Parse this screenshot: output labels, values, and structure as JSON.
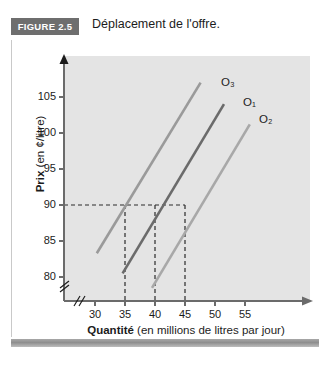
{
  "figure": {
    "badge": "FIGURE 2.5",
    "caption": "Déplacement de l'offre."
  },
  "colors": {
    "badge_bg": "#6e6e6e",
    "plot_bg": "#e4e4e4",
    "axis": "#6b6b6b",
    "curve_o1": "#6b6b6b",
    "curve_o2": "#a8a8a8",
    "curve_o3": "#9a9a9a",
    "dashed": "#2b2b2b",
    "text": "#1c1c1c"
  },
  "chart_data": {
    "type": "line",
    "title": "Déplacement de l'offre.",
    "xlabel_bold": "Quantité",
    "xlabel_rest": " (en millions de litres par jour)",
    "ylabel_bold": "Prix",
    "ylabel_rest": " (en ¢/litre)",
    "xlim": [
      27.5,
      57.5
    ],
    "ylim": [
      77.5,
      108.5
    ],
    "xticks": [
      30,
      35,
      40,
      45,
      50,
      55
    ],
    "yticks": [
      80,
      85,
      90,
      95,
      100,
      105
    ],
    "xtick_labels": [
      "30",
      "35",
      "40",
      "45",
      "50",
      "55"
    ],
    "ytick_labels": [
      "80",
      "85",
      "90",
      "95",
      "100",
      "105"
    ],
    "axis_break_x": true,
    "axis_break_y": true,
    "grid": false,
    "legend": "inline-labels",
    "series": [
      {
        "name": "O3",
        "label": "O₃",
        "color": "#9a9a9a",
        "points": [
          [
            30.3,
            83.3
          ],
          [
            47.6,
            107.0
          ]
        ],
        "reference_point": [
          35,
          90
        ]
      },
      {
        "name": "O1",
        "label": "O₁",
        "color": "#6b6b6b",
        "points": [
          [
            34.6,
            80.5
          ],
          [
            51.5,
            104.0
          ]
        ],
        "reference_point": [
          40,
          90
        ]
      },
      {
        "name": "O2",
        "label": "O₂",
        "color": "#a8a8a8",
        "points": [
          [
            39.5,
            78.5
          ],
          [
            55.8,
            101.2
          ]
        ],
        "reference_point": [
          45,
          90
        ]
      }
    ],
    "annotations": {
      "price_guide": 90,
      "quantity_guides": [
        35,
        40,
        45
      ],
      "description": "Trois courbes d'offre parallèles; au prix de 90 ¢/litre les quantités offertes sont 35, 40 et 45 millions de litres par jour."
    }
  }
}
